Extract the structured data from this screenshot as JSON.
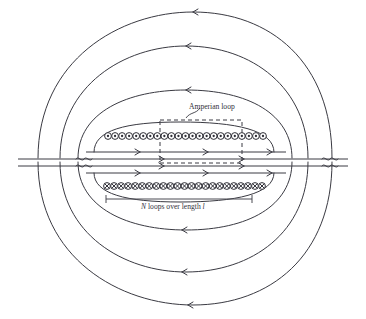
{
  "figure": {
    "background_color": "#ffffff",
    "stroke_color": "#3a3a42",
    "width": 366,
    "height": 319
  },
  "labels": {
    "amperian_loop": "Amperian loop",
    "loops_length_prefix": "N",
    "loops_length_middle": " loops over length ",
    "loops_length_suffix": "l",
    "loops_length_full": "N loops over length l"
  },
  "chart_data": {
    "type": "diagram",
    "annotations": [
      "Amperian loop",
      "N loops over length l"
    ],
    "coils": {
      "top_row": {
        "symbol": "circle-dot",
        "meaning": "current out of page",
        "count": 23,
        "x_start": 108,
        "x_end": 263,
        "y": 136,
        "radius": 3.4
      },
      "bottom_row": {
        "symbol": "circle-cross",
        "meaning": "current into page",
        "count": 23,
        "x_start": 107,
        "x_end": 262,
        "y": 186,
        "radius": 3.4
      }
    },
    "interior_field_lines": {
      "count": 4,
      "direction": "right",
      "y_values": [
        152,
        159,
        166,
        173
      ]
    },
    "exterior_field_lines": {
      "count": 4,
      "direction": "left",
      "description": "closed loops returning outside the solenoid"
    },
    "amperian_loop_rect": {
      "x": 160,
      "y": 120,
      "width": 82,
      "height": 43
    },
    "measurement_bar": {
      "x_start": 106,
      "x_end": 252,
      "y": 199
    }
  }
}
